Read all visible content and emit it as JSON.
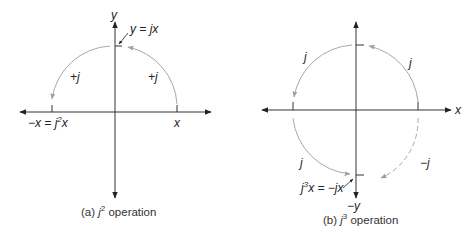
{
  "diagram_a": {
    "y_axis_label": "y",
    "x_axis_label": "x",
    "top_point_label": "y = jx",
    "left_arc_label": "+j",
    "right_arc_label": "+j",
    "neg_x_label_prefix": "−x = j",
    "neg_x_label_sup": "2",
    "neg_x_label_suffix": "x",
    "caption_prefix": "(a) ",
    "caption_j": "j",
    "caption_sup": "2",
    "caption_suffix": " operation"
  },
  "diagram_b": {
    "x_axis_label": "x",
    "neg_y_label": "−y",
    "upper_left_arc_label": "j",
    "upper_right_arc_label": "j",
    "lower_left_arc_label": "j",
    "lower_right_arc_label": "−j",
    "bottom_point_label_j": "j",
    "bottom_point_label_sup": "3",
    "bottom_point_label_suffix": "x = −jx",
    "caption_prefix": "(b) ",
    "caption_j": "j",
    "caption_sup": "3",
    "caption_suffix": " operation"
  },
  "colors": {
    "axis": "#333333",
    "arc": "#a8a8a8",
    "text": "#222222"
  }
}
